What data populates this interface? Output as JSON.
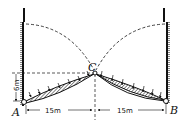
{
  "diagram": {
    "type": "structural-diagram",
    "points": {
      "A": "A",
      "B": "B",
      "C": "C"
    },
    "dimensions": {
      "rise": "6m",
      "left_span": "15m",
      "right_span": "15m"
    },
    "colors": {
      "line": "#111111",
      "background": "#ffffff"
    }
  }
}
